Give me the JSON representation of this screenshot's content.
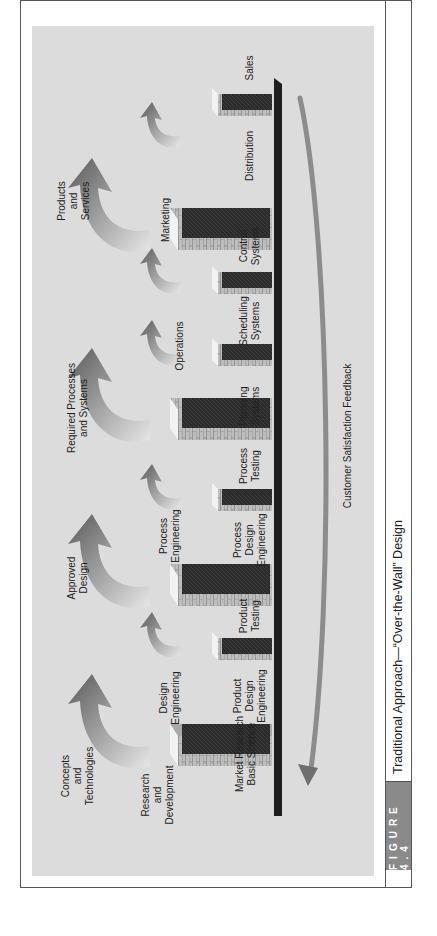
{
  "figure": {
    "number_label": "FIGURE 4.4",
    "caption": "Traditional Approach—“Over-the-Wall” Design"
  },
  "stages": [
    {
      "label": "Market Research\nBasic Science"
    },
    {
      "label": "Research\nand\nDevelopment"
    },
    {
      "label": "Product\nDesign\nEngineering"
    },
    {
      "label": "Design\nEngineering"
    },
    {
      "label": "Product\nTesting"
    },
    {
      "label": "Process\nDesign\nEngineering"
    },
    {
      "label": "Process\nEngineering"
    },
    {
      "label": "Process\nTesting"
    },
    {
      "label": "Planning\nSystems"
    },
    {
      "label": "Operations"
    },
    {
      "label": "Scheduling\nSystems"
    },
    {
      "label": "Control\nSystems"
    },
    {
      "label": "Marketing"
    },
    {
      "label": "Distribution"
    },
    {
      "label": "Sales"
    }
  ],
  "handoffs": [
    {
      "label": "Concepts\nand\nTechnologies"
    },
    {
      "label": "Approved\nDesign"
    },
    {
      "label": "Required Processes\nand Systems"
    },
    {
      "label": "Products\nand\nServices"
    }
  ],
  "feedback": {
    "label": "Customer Satisfaction Feedback"
  },
  "colors": {
    "panel": "#dcdcdc",
    "wall_dark": "#2a2a2a",
    "wall_brick": "#b8b8b8",
    "baseline": "#1e1e1e",
    "feedback_arrow": "#8c8c8c",
    "figure_tab": "#8a8a8a"
  }
}
